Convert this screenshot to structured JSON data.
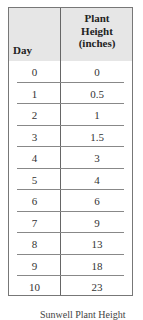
{
  "table": {
    "headers": {
      "day": "Day",
      "height": "Plant\nHeight\n(inches)"
    },
    "header_lines": [
      "Plant",
      "Height",
      "(inches)"
    ],
    "rows": [
      {
        "day": "0",
        "height": "0"
      },
      {
        "day": "1",
        "height": "0.5"
      },
      {
        "day": "2",
        "height": "1"
      },
      {
        "day": "3",
        "height": "1.5"
      },
      {
        "day": "4",
        "height": "3"
      },
      {
        "day": "5",
        "height": "4"
      },
      {
        "day": "6",
        "height": "6"
      },
      {
        "day": "7",
        "height": "9"
      },
      {
        "day": "8",
        "height": "13"
      },
      {
        "day": "9",
        "height": "18"
      },
      {
        "day": "10",
        "height": "23"
      }
    ]
  },
  "caption": "Sunwell Plant Height"
}
